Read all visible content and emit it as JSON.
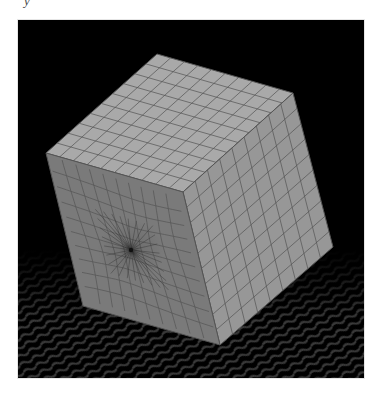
{
  "figure": {
    "caption_fragment": "y",
    "background_color": "#000000",
    "page_background": "#ffffff",
    "faces": {
      "top": {
        "color": "#a9a9a9",
        "grid": [
          10,
          10
        ],
        "corners": [
          [
            157,
            54
          ],
          [
            293,
            93
          ],
          [
            183,
            192
          ],
          [
            46,
            153
          ]
        ]
      },
      "right": {
        "color": "#979797",
        "grid": [
          9,
          10
        ],
        "corners": [
          [
            183,
            192
          ],
          [
            293,
            93
          ],
          [
            333,
            247
          ],
          [
            220,
            345
          ]
        ]
      },
      "left": {
        "color": "#7a7a7a",
        "grid": [
          10,
          10
        ],
        "pole": [
          131,
          250
        ],
        "corners": [
          [
            46,
            153
          ],
          [
            183,
            192
          ],
          [
            220,
            345
          ],
          [
            83,
            306
          ]
        ]
      }
    },
    "edge_color": "#555555",
    "floor": {
      "style": "wavy reflective moire",
      "color": "#2a2a2a"
    }
  }
}
